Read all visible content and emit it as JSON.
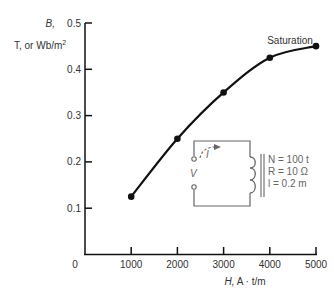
{
  "chart_data": {
    "type": "line",
    "title": "",
    "xlabel": "H, A · t/m",
    "ylabel": "B, T, or Wb/m²",
    "x": [
      1000,
      2000,
      3000,
      4000,
      5000
    ],
    "series": [
      {
        "name": "B-H magnetization curve",
        "values": [
          0.125,
          0.25,
          0.35,
          0.425,
          0.45
        ]
      }
    ],
    "xlim": [
      0,
      5000
    ],
    "ylim": [
      0,
      0.5
    ],
    "x_ticks": [
      "1000",
      "2000",
      "3000",
      "4000",
      "5000"
    ],
    "y_ticks": [
      "0.1",
      "0.2",
      "0.3",
      "0.4",
      "0.5"
    ],
    "origin_label": "0",
    "grid": false,
    "annotations": [
      {
        "text": "Saturation",
        "x": 5000,
        "y": 0.45
      }
    ]
  },
  "axes": {
    "y_label_symbol": "B,",
    "y_label_units": "T, or Wb/m",
    "y_label_sup": "2",
    "x_label_symbol": "H,",
    "x_label_units": "A · t/m"
  },
  "circuit": {
    "voltage_label": "V",
    "current_label": "I",
    "params": [
      "N = 100 t",
      "R = 10 Ω",
      "l = 0.2 m"
    ]
  }
}
